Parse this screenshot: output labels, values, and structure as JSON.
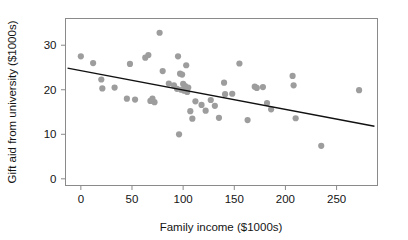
{
  "chart_data": {
    "type": "scatter",
    "title": "",
    "xlabel": "Family income ($1000s)",
    "ylabel": "Gift aid from university ($1000s)",
    "xlim": [
      -15,
      290
    ],
    "ylim": [
      -1.5,
      36
    ],
    "xticks": [
      0,
      50,
      100,
      150,
      200,
      250
    ],
    "xtick_labels": [
      "0",
      "50",
      "100",
      "150",
      "200",
      "250"
    ],
    "yticks": [
      0,
      10,
      20,
      30
    ],
    "ytick_labels": [
      "0",
      "10",
      "20",
      "30"
    ],
    "grid": false,
    "legend": null,
    "point_color": "#9d9d9d",
    "point_radius": 3.1,
    "frame_color": "#8a8a8a",
    "n_points": 50,
    "points": [
      {
        "x": 0,
        "y": 27.5
      },
      {
        "x": 12,
        "y": 26.0
      },
      {
        "x": 20,
        "y": 22.3
      },
      {
        "x": 21,
        "y": 20.3
      },
      {
        "x": 33,
        "y": 20.5
      },
      {
        "x": 45,
        "y": 18.0
      },
      {
        "x": 53,
        "y": 17.8
      },
      {
        "x": 48,
        "y": 25.8
      },
      {
        "x": 63,
        "y": 27.2
      },
      {
        "x": 66,
        "y": 27.8
      },
      {
        "x": 68,
        "y": 17.5
      },
      {
        "x": 72,
        "y": 17.2
      },
      {
        "x": 70,
        "y": 18.0
      },
      {
        "x": 77,
        "y": 32.8
      },
      {
        "x": 80,
        "y": 24.2
      },
      {
        "x": 86,
        "y": 21.4
      },
      {
        "x": 91,
        "y": 21.0
      },
      {
        "x": 95,
        "y": 27.5
      },
      {
        "x": 97,
        "y": 23.6
      },
      {
        "x": 99,
        "y": 23.4
      },
      {
        "x": 103,
        "y": 25.5
      },
      {
        "x": 100,
        "y": 21.3
      },
      {
        "x": 102,
        "y": 20.8
      },
      {
        "x": 105,
        "y": 20.5
      },
      {
        "x": 101,
        "y": 19.8
      },
      {
        "x": 104,
        "y": 19.5
      },
      {
        "x": 98,
        "y": 20.0
      },
      {
        "x": 94,
        "y": 20.2
      },
      {
        "x": 107,
        "y": 15.2
      },
      {
        "x": 109,
        "y": 13.5
      },
      {
        "x": 96,
        "y": 10.0
      },
      {
        "x": 112,
        "y": 17.4
      },
      {
        "x": 118,
        "y": 16.6
      },
      {
        "x": 122,
        "y": 15.3
      },
      {
        "x": 127,
        "y": 17.7
      },
      {
        "x": 131,
        "y": 16.4
      },
      {
        "x": 135,
        "y": 13.7
      },
      {
        "x": 140,
        "y": 21.6
      },
      {
        "x": 141,
        "y": 19.0
      },
      {
        "x": 148,
        "y": 19.1
      },
      {
        "x": 155,
        "y": 25.9
      },
      {
        "x": 163,
        "y": 13.2
      },
      {
        "x": 170,
        "y": 20.7
      },
      {
        "x": 172,
        "y": 20.4
      },
      {
        "x": 178,
        "y": 20.6
      },
      {
        "x": 182,
        "y": 17.0
      },
      {
        "x": 186,
        "y": 15.6
      },
      {
        "x": 207,
        "y": 23.1
      },
      {
        "x": 208,
        "y": 21.0
      },
      {
        "x": 210,
        "y": 13.6
      },
      {
        "x": 235,
        "y": 7.4
      },
      {
        "x": 272,
        "y": 19.9
      }
    ],
    "trend_line": {
      "type": "linear-fit",
      "intercept": 24.3,
      "slope": -0.0435,
      "x_start": -13,
      "x_end": 287
    }
  }
}
